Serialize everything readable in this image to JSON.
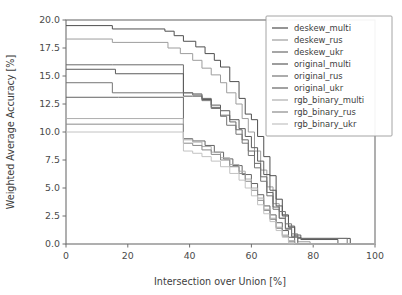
{
  "chart_data": {
    "type": "line",
    "title": "",
    "xlabel": "Intersection over Union [%]",
    "ylabel": "Weighted Average Accuracy [%]",
    "xlim": [
      0,
      100
    ],
    "ylim": [
      0,
      20
    ],
    "xticks": [
      0,
      20,
      40,
      60,
      80,
      100
    ],
    "yticks": [
      0.0,
      2.5,
      5.0,
      7.5,
      10.0,
      12.5,
      15.0,
      17.5,
      20.0
    ],
    "xticklabels": [
      "0",
      "20",
      "40",
      "60",
      "80",
      "100"
    ],
    "yticklabels": [
      "0.0",
      "2.5",
      "5.0",
      "7.5",
      "10.0",
      "12.5",
      "15.0",
      "17.5",
      "20.0"
    ],
    "grid": false,
    "legend_position": "upper right",
    "series": [
      {
        "name": "deskew_multi",
        "color": "#4f4f4f",
        "x": [
          0,
          15,
          15,
          32,
          32,
          35,
          35,
          38,
          38,
          42,
          42,
          45,
          45,
          48,
          48,
          50,
          50,
          53,
          53,
          56,
          56,
          58,
          58,
          60,
          60,
          62,
          62,
          64,
          64,
          66,
          66,
          68,
          68,
          70,
          70,
          72,
          72,
          74,
          74,
          76,
          76,
          92,
          92,
          100
        ],
        "y": [
          19.5,
          19.5,
          19.2,
          19.2,
          19.0,
          19.0,
          18.6,
          18.6,
          18.1,
          18.1,
          17.6,
          17.6,
          17.0,
          17.0,
          16.4,
          16.4,
          15.8,
          15.8,
          14.5,
          14.5,
          13.0,
          13.0,
          11.6,
          11.6,
          11.1,
          11.1,
          9.6,
          9.6,
          7.8,
          7.8,
          6.1,
          6.1,
          4.0,
          4.0,
          2.6,
          2.6,
          1.5,
          1.5,
          0.6,
          0.6,
          0.5,
          0.5,
          0.0,
          0.0
        ]
      },
      {
        "name": "deskew_rus",
        "color": "#9d9d9d",
        "x": [
          0,
          15,
          15,
          33,
          33,
          37,
          37,
          41,
          41,
          44,
          44,
          47,
          47,
          50,
          50,
          52,
          52,
          55,
          55,
          57,
          57,
          59,
          59,
          61,
          61,
          63,
          63,
          65,
          65,
          67,
          67,
          69,
          69,
          71,
          71,
          73,
          73,
          75,
          75,
          79,
          79,
          100
        ],
        "y": [
          18.3,
          18.3,
          18.0,
          18.0,
          17.5,
          17.5,
          17.0,
          17.0,
          16.4,
          16.4,
          15.7,
          15.7,
          15.1,
          15.1,
          14.4,
          14.4,
          13.5,
          13.5,
          12.5,
          12.5,
          11.2,
          11.2,
          10.0,
          10.0,
          8.3,
          8.3,
          6.6,
          6.6,
          5.1,
          5.1,
          3.6,
          3.6,
          2.3,
          2.3,
          1.3,
          1.3,
          0.6,
          0.6,
          0.2,
          0.2,
          0.0,
          0.0
        ]
      },
      {
        "name": "deskew_ukr",
        "color": "#6a6a6a",
        "x": [
          0,
          15,
          15,
          38,
          38,
          41,
          41,
          44,
          44,
          47,
          47,
          50,
          50,
          53,
          53,
          55,
          55,
          57,
          57,
          59,
          59,
          61,
          61,
          63,
          63,
          65,
          65,
          67,
          67,
          69,
          69,
          71,
          71,
          73,
          73,
          75,
          75,
          100
        ],
        "y": [
          16.0,
          16.0,
          16.0,
          16.0,
          13.5,
          13.5,
          13.4,
          13.4,
          13.0,
          13.0,
          12.2,
          12.2,
          11.5,
          11.5,
          10.9,
          10.9,
          10.2,
          10.2,
          9.3,
          9.3,
          8.3,
          8.3,
          7.2,
          7.2,
          6.0,
          6.0,
          4.6,
          4.6,
          3.3,
          3.3,
          2.3,
          2.3,
          1.4,
          1.4,
          0.7,
          0.7,
          0.0,
          0.0
        ]
      },
      {
        "name": "original_multi",
        "color": "#5b5b5b",
        "x": [
          0,
          16,
          16,
          38,
          38,
          41,
          41,
          44,
          44,
          47,
          47,
          50,
          50,
          53,
          53,
          56,
          56,
          58,
          58,
          60,
          60,
          62,
          62,
          64,
          64,
          66,
          66,
          68,
          68,
          70,
          70,
          72,
          72,
          74,
          74,
          76,
          76,
          88,
          88,
          100
        ],
        "y": [
          15.6,
          15.6,
          15.2,
          15.2,
          13.2,
          13.2,
          13.2,
          13.2,
          12.9,
          12.9,
          12.4,
          12.4,
          11.9,
          11.9,
          11.1,
          11.1,
          10.3,
          10.3,
          9.6,
          9.6,
          8.6,
          8.6,
          7.4,
          7.4,
          6.2,
          6.2,
          4.8,
          4.8,
          3.4,
          3.4,
          2.5,
          2.5,
          1.6,
          1.6,
          0.8,
          0.8,
          0.4,
          0.4,
          0.0,
          0.0
        ]
      },
      {
        "name": "original_rus",
        "color": "#757575",
        "x": [
          0,
          15,
          15,
          38,
          38,
          41,
          41,
          44,
          44,
          47,
          47,
          50,
          50,
          52,
          52,
          55,
          55,
          57,
          57,
          59,
          59,
          61,
          61,
          63,
          63,
          65,
          65,
          67,
          67,
          69,
          69,
          71,
          71,
          73,
          73,
          75,
          75,
          91,
          91,
          100
        ],
        "y": [
          14.4,
          14.4,
          13.5,
          13.5,
          13.5,
          13.5,
          13.3,
          13.3,
          12.8,
          12.8,
          12.1,
          12.1,
          11.4,
          11.4,
          10.6,
          10.6,
          9.8,
          9.8,
          9.0,
          9.0,
          7.9,
          7.9,
          6.8,
          6.8,
          5.6,
          5.6,
          4.3,
          4.3,
          3.1,
          3.1,
          2.9,
          2.9,
          1.8,
          1.8,
          0.9,
          0.9,
          0.5,
          0.5,
          0.0,
          0.0
        ]
      },
      {
        "name": "original_ukr",
        "color": "#646464",
        "x": [
          0,
          17,
          17,
          38,
          38,
          41,
          41,
          45,
          45,
          48,
          48,
          51,
          51,
          54,
          54,
          57,
          57,
          60,
          60,
          62,
          62,
          64,
          64,
          66,
          66,
          68,
          68,
          70,
          70,
          72,
          72,
          74,
          74,
          76,
          76,
          100
        ],
        "y": [
          13.1,
          13.1,
          13.1,
          13.1,
          9.4,
          9.4,
          9.2,
          9.2,
          8.8,
          8.8,
          8.2,
          8.2,
          7.6,
          7.6,
          7.0,
          7.0,
          6.2,
          6.2,
          5.4,
          5.4,
          4.4,
          4.4,
          3.4,
          3.4,
          2.6,
          2.6,
          1.9,
          1.9,
          1.2,
          1.2,
          0.6,
          0.6,
          0.0,
          0.0,
          0.0,
          0.0
        ]
      },
      {
        "name": "rgb_binary_multi",
        "color": "#aeaeae",
        "x": [
          0,
          38,
          38,
          41,
          41,
          44,
          44,
          47,
          47,
          50,
          50,
          53,
          53,
          56,
          56,
          58,
          58,
          60,
          60,
          62,
          62,
          64,
          64,
          66,
          66,
          68,
          68,
          70,
          70,
          72,
          72,
          74,
          74,
          100
        ],
        "y": [
          11.2,
          11.2,
          9.3,
          9.3,
          9.1,
          9.1,
          8.7,
          8.7,
          8.2,
          8.2,
          7.7,
          7.7,
          7.1,
          7.1,
          6.5,
          6.5,
          5.8,
          5.8,
          5.0,
          5.0,
          4.1,
          4.1,
          3.1,
          3.1,
          2.3,
          2.3,
          1.5,
          1.5,
          0.8,
          0.8,
          0.3,
          0.3,
          0.0,
          0.0
        ]
      },
      {
        "name": "rgb_binary_rus",
        "color": "#8a8a8a",
        "x": [
          0,
          38,
          38,
          41,
          41,
          44,
          44,
          47,
          47,
          50,
          50,
          53,
          53,
          56,
          56,
          58,
          58,
          60,
          60,
          62,
          62,
          64,
          64,
          66,
          66,
          68,
          68,
          70,
          70,
          72,
          72,
          74,
          74,
          100
        ],
        "y": [
          10.7,
          10.7,
          9.0,
          9.0,
          8.8,
          8.8,
          8.4,
          8.4,
          8.0,
          8.0,
          7.5,
          7.5,
          6.9,
          6.9,
          6.3,
          6.3,
          5.6,
          5.6,
          4.8,
          4.8,
          3.9,
          3.9,
          3.0,
          3.0,
          2.2,
          2.2,
          1.4,
          1.4,
          0.7,
          0.7,
          0.2,
          0.2,
          0.0,
          0.0
        ]
      },
      {
        "name": "rgb_binary_ukr",
        "color": "#c2c2c2",
        "x": [
          0,
          38,
          38,
          41,
          41,
          44,
          44,
          47,
          47,
          50,
          50,
          53,
          53,
          56,
          56,
          58,
          58,
          60,
          60,
          62,
          62,
          64,
          64,
          66,
          66,
          68,
          68,
          70,
          70,
          72,
          72,
          74,
          74,
          100
        ],
        "y": [
          10.0,
          10.0,
          8.3,
          8.3,
          8.1,
          8.1,
          7.8,
          7.8,
          7.4,
          7.4,
          6.9,
          6.9,
          6.3,
          6.3,
          5.7,
          5.7,
          5.0,
          5.0,
          4.3,
          4.3,
          3.5,
          3.5,
          2.7,
          2.7,
          2.0,
          2.0,
          1.2,
          1.2,
          0.6,
          0.6,
          0.1,
          0.1,
          0.0,
          0.0
        ]
      }
    ]
  }
}
